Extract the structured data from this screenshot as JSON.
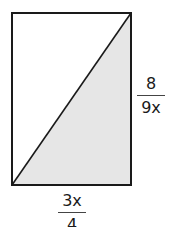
{
  "diagram": {
    "shape": "rectangle",
    "shaded_region": "lower-right triangle below diagonal",
    "colors": {
      "stroke": "#1a1a1a",
      "fill_shaded": "#e6e6e6",
      "background": "#ffffff"
    },
    "labels": {
      "right_side": {
        "numerator": "8",
        "denominator": "9x"
      },
      "bottom_side": {
        "numerator": "3x",
        "denominator": "4"
      }
    }
  }
}
